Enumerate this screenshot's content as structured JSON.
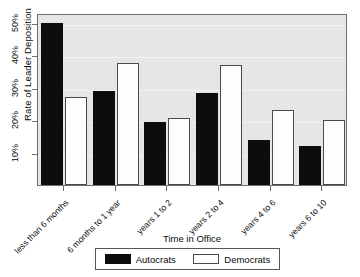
{
  "chart_data": {
    "type": "bar",
    "title": "",
    "xlabel": "Time in Office",
    "ylabel": "Rate of Leader Deposition",
    "categories": [
      "less than 6 months",
      "6 months to 1 year",
      "years 1 to 2",
      "years 2 to 4",
      "years 4 to 6",
      "years 6 to 10"
    ],
    "series": [
      {
        "name": "Autocrats",
        "color": "#0d0d0d",
        "values": [
          50,
          29,
          19.5,
          28.5,
          14,
          12
        ]
      },
      {
        "name": "Democrats",
        "color": "#ffffff",
        "values": [
          27,
          37.5,
          20.5,
          37,
          23,
          20
        ]
      }
    ],
    "ylim": [
      0,
      53
    ],
    "yticks": [
      10,
      20,
      30,
      40,
      50
    ],
    "ytick_labels": [
      "10%",
      "20%",
      "30%",
      "40%",
      "50%"
    ],
    "grid": false,
    "legend_position": "bottom",
    "legend_entries": [
      "Autocrats",
      "Democrats"
    ]
  },
  "legend": {
    "autocrats_label": "Autocrats",
    "democrats_label": "Democrats"
  }
}
